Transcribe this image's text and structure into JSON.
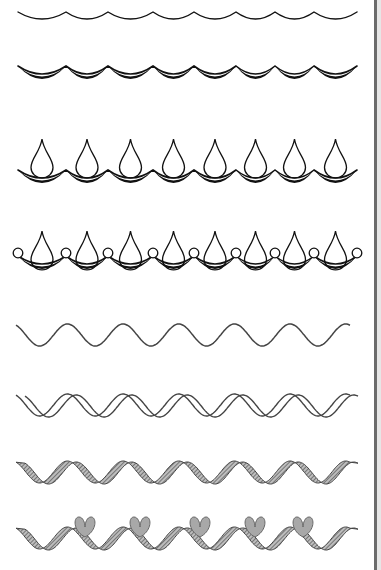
{
  "illustration": {
    "subject": "step-by-step decorative border patterns",
    "ink_color": "#111111",
    "wave_color": "#444444",
    "hatch_color": "#555555",
    "heart_fill": "#a8a8a8",
    "background": "#ffffff",
    "rows": [
      {
        "name": "single-scallop",
        "count": 8
      },
      {
        "name": "double-scallop-shaded",
        "count": 8
      },
      {
        "name": "scallop-with-drops",
        "count": 8
      },
      {
        "name": "scallop-drops-circles",
        "count": 8,
        "circles": 9
      },
      {
        "name": "single-wave",
        "periods": 6
      },
      {
        "name": "double-wave",
        "periods": 6
      },
      {
        "name": "hatched-ribbon-wave",
        "periods": 6
      },
      {
        "name": "ribbon-wave-with-hearts",
        "periods": 6,
        "hearts": 5
      }
    ]
  }
}
